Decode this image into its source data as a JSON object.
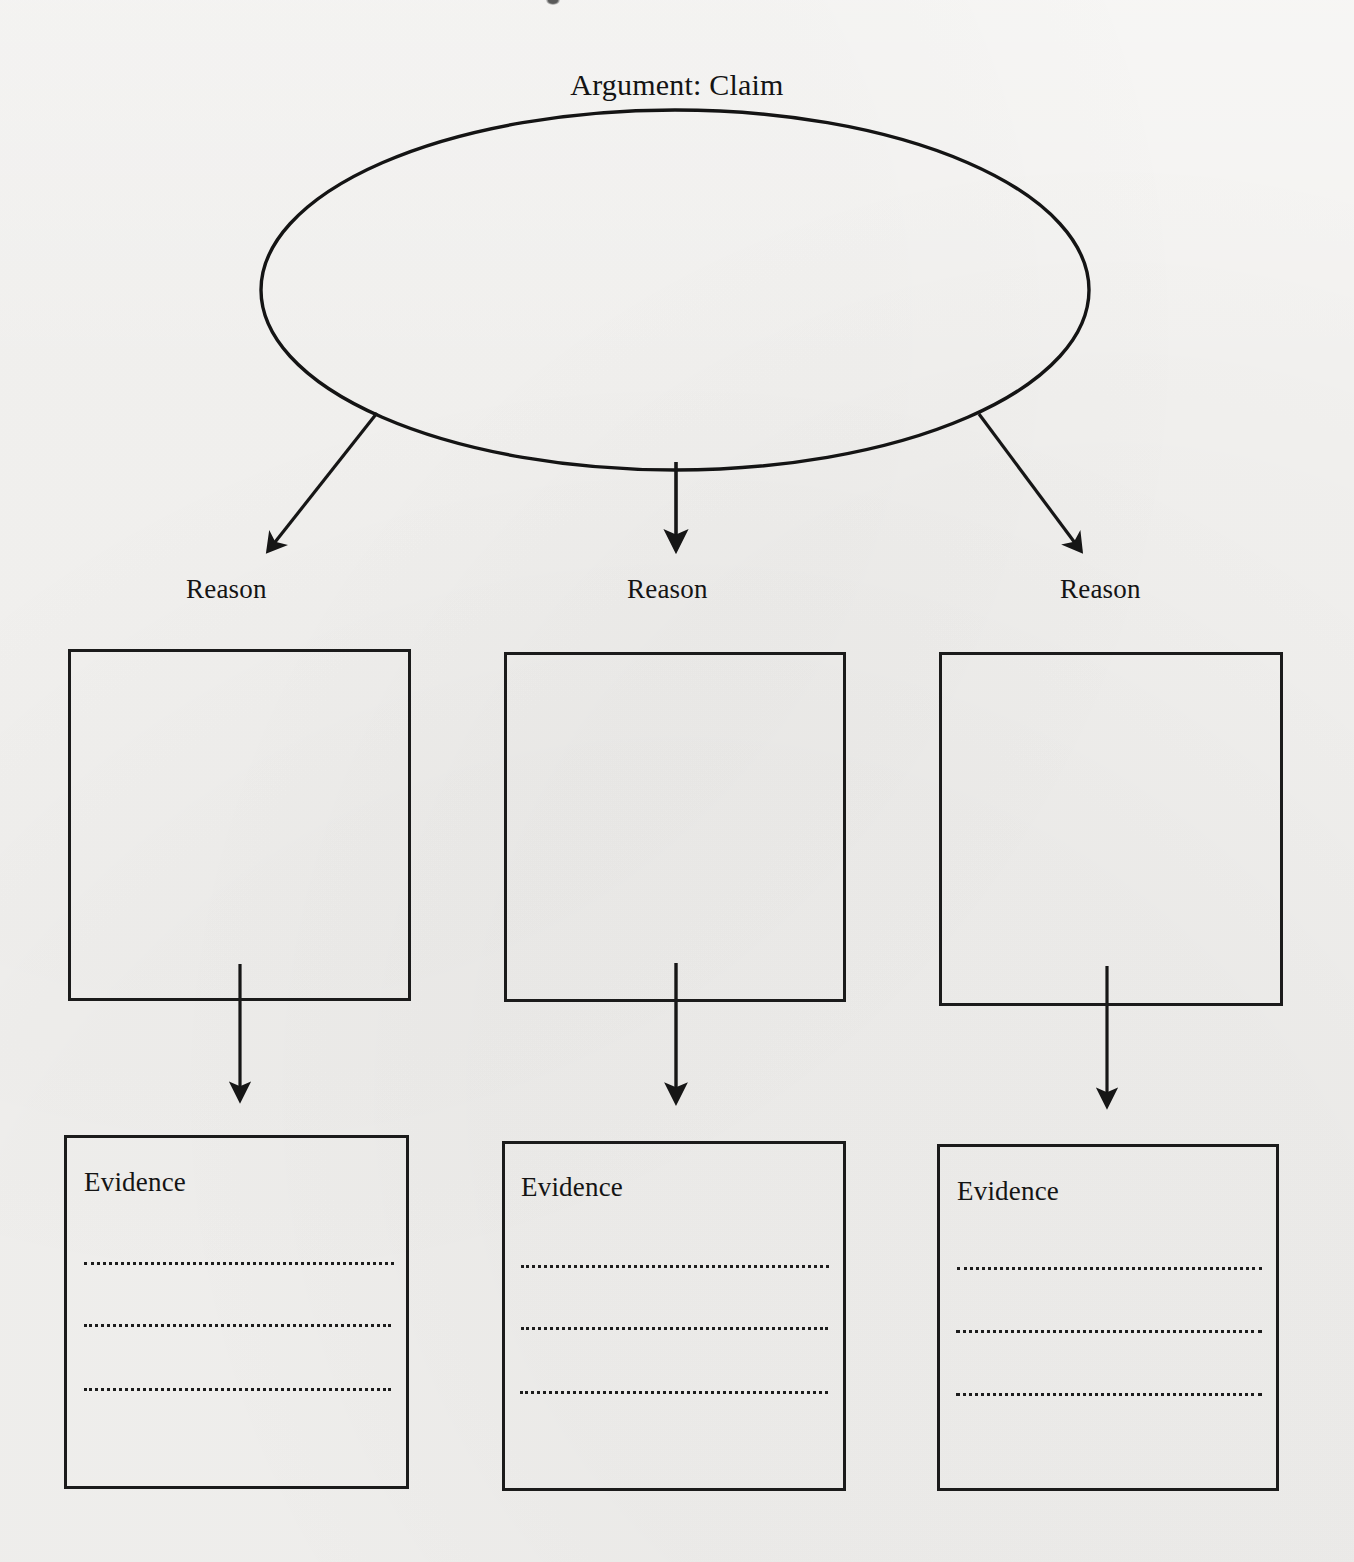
{
  "page": {
    "background_color": "#f3f2f0",
    "ink_color": "#1b1b1b",
    "width": 1354,
    "height": 1562
  },
  "title": {
    "text": "Argument: Claim"
  },
  "claim": {
    "shape": "ellipse",
    "content": ""
  },
  "branches": [
    {
      "reason_label": "Reason",
      "reason_content": "",
      "evidence_label": "Evidence",
      "evidence_lines": [
        "",
        "",
        ""
      ]
    },
    {
      "reason_label": "Reason",
      "reason_content": "",
      "evidence_label": "Evidence",
      "evidence_lines": [
        "",
        "",
        ""
      ]
    },
    {
      "reason_label": "Reason",
      "reason_content": "",
      "evidence_label": "Evidence",
      "evidence_lines": [
        "",
        "",
        ""
      ]
    }
  ],
  "connectors": {
    "claim_to_reason": [
      "arrow-down-left",
      "arrow-down",
      "arrow-down-right"
    ],
    "reason_to_evidence": [
      "arrow-down",
      "arrow-down",
      "arrow-down"
    ]
  }
}
